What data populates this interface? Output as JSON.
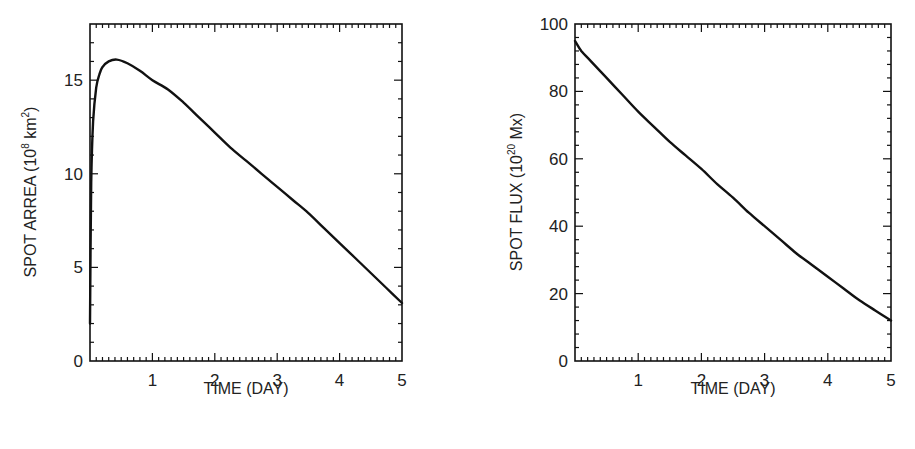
{
  "chart_data": [
    {
      "type": "line",
      "title": "",
      "xlabel": "TIME (DAY)",
      "ylabel": "SPOT ARREA (10^8 km^2)",
      "ylabel_parts": {
        "main": "SPOT ARREA (10",
        "sup1": "8",
        "mid": " km",
        "sup2": "2",
        "end": ")"
      },
      "xlim": [
        0,
        5
      ],
      "ylim": [
        0,
        18
      ],
      "x_ticks": [
        1,
        2,
        3,
        4,
        5
      ],
      "x_tick_labels": [
        "1",
        "2",
        "3",
        "4",
        "5"
      ],
      "y_ticks": [
        0,
        5,
        10,
        15
      ],
      "y_tick_labels": [
        "0",
        "5",
        "10",
        "15"
      ],
      "grid": false,
      "legend": null,
      "series": [
        {
          "name": "spot area",
          "x": [
            0.0,
            0.02,
            0.05,
            0.1,
            0.15,
            0.2,
            0.3,
            0.43,
            0.6,
            0.8,
            1.0,
            1.25,
            1.5,
            1.75,
            2.0,
            2.25,
            2.5,
            2.75,
            3.0,
            3.25,
            3.5,
            3.75,
            4.0,
            4.25,
            4.5,
            4.75,
            5.0
          ],
          "y": [
            2.0,
            9.5,
            12.8,
            14.6,
            15.3,
            15.7,
            16.0,
            16.1,
            15.9,
            15.5,
            15.0,
            14.5,
            13.8,
            13.0,
            12.2,
            11.4,
            10.7,
            10.0,
            9.3,
            8.6,
            7.9,
            7.1,
            6.3,
            5.5,
            4.7,
            3.9,
            3.1
          ]
        }
      ]
    },
    {
      "type": "line",
      "title": "",
      "xlabel": "TIME (DAY)",
      "ylabel": "SPOT FLUX (10^20 Mx)",
      "ylabel_parts": {
        "main": "SPOT FLUX (10",
        "sup1": "20",
        "mid": " Mx)",
        "sup2": "",
        "end": ""
      },
      "xlim": [
        0,
        5
      ],
      "ylim": [
        0,
        100
      ],
      "x_ticks": [
        1,
        2,
        3,
        4,
        5
      ],
      "x_tick_labels": [
        "1",
        "2",
        "3",
        "4",
        "5"
      ],
      "y_ticks": [
        0,
        20,
        40,
        60,
        80,
        100
      ],
      "y_tick_labels": [
        "0",
        "20",
        "40",
        "60",
        "80",
        "100"
      ],
      "grid": false,
      "legend": null,
      "series": [
        {
          "name": "spot flux",
          "x": [
            0.0,
            0.1,
            0.25,
            0.5,
            0.75,
            1.0,
            1.25,
            1.5,
            1.75,
            2.0,
            2.25,
            2.5,
            2.75,
            3.0,
            3.25,
            3.5,
            3.75,
            4.0,
            4.25,
            4.5,
            4.75,
            5.0
          ],
          "y": [
            95,
            92,
            89,
            84,
            79,
            74,
            69.5,
            65,
            61,
            57,
            52.5,
            48.5,
            44,
            40,
            36,
            32,
            28.5,
            25,
            21.5,
            18,
            15,
            12
          ]
        }
      ]
    }
  ]
}
